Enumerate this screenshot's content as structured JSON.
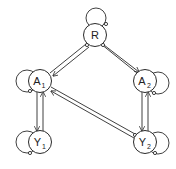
{
  "diagram": {
    "type": "directed-graph",
    "colors": {
      "stroke": "#2a2a2a",
      "background": "#ffffff"
    },
    "nodes": [
      {
        "id": "R",
        "label": "R",
        "sub": "",
        "x": 95,
        "y": 35,
        "self_loop": "top"
      },
      {
        "id": "A1",
        "label": "A",
        "sub": "1",
        "x": 40,
        "y": 81,
        "self_loop": "left"
      },
      {
        "id": "A2",
        "label": "A",
        "sub": "2",
        "x": 145,
        "y": 81,
        "self_loop": "right"
      },
      {
        "id": "Y1",
        "label": "Y",
        "sub": "1",
        "x": 40,
        "y": 142,
        "self_loop": "left"
      },
      {
        "id": "Y2",
        "label": "Y",
        "sub": "2",
        "x": 145,
        "y": 142,
        "self_loop": "right"
      }
    ],
    "edges": [
      {
        "from": "R",
        "to": "A1",
        "style": "double-arrow"
      },
      {
        "from": "R",
        "to": "A2",
        "style": "double-arrow"
      },
      {
        "from": "A1",
        "to": "Y1",
        "style": "double-arrow"
      },
      {
        "from": "Y1",
        "to": "A1",
        "style": "double-arrow"
      },
      {
        "from": "A2",
        "to": "Y2",
        "style": "double-arrow"
      },
      {
        "from": "Y2",
        "to": "A2",
        "style": "double-arrow"
      },
      {
        "from": "Y2",
        "to": "A1",
        "style": "double-arrow"
      }
    ]
  }
}
